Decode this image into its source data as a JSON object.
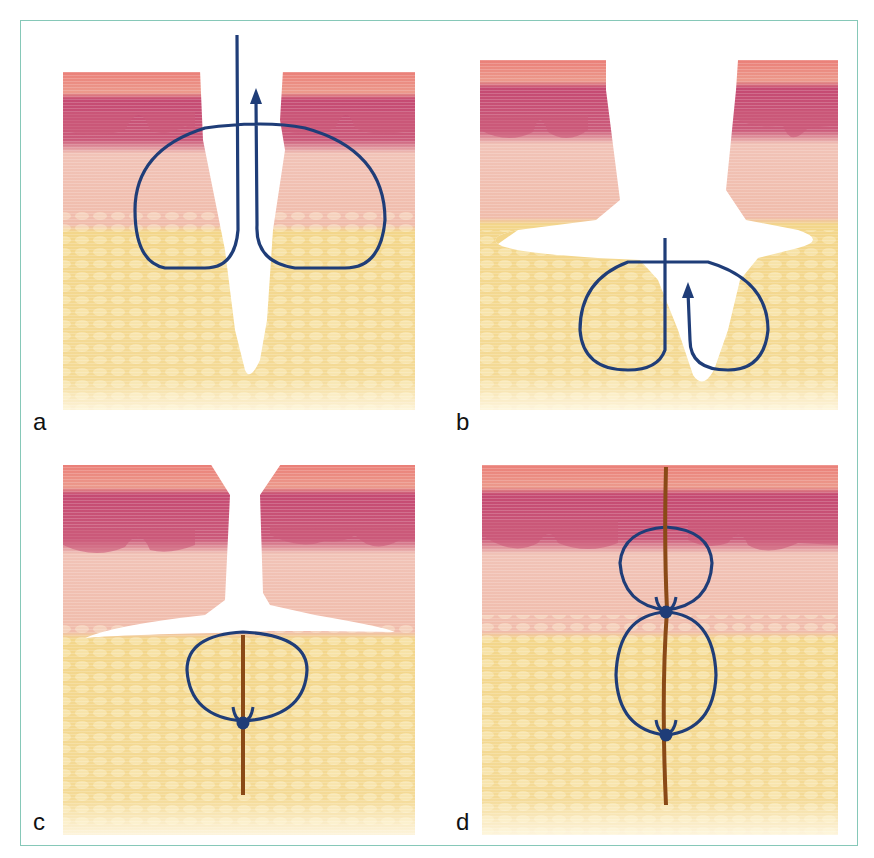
{
  "figure": {
    "frame_color": "#86c8b8",
    "colors": {
      "epidermis_top": "#ea7f78",
      "epidermis_mid": "#c3476d",
      "dermis": "#f3c2b6",
      "dermis_lower": "#eeb6a6",
      "fat": "#f3d68a",
      "fat_light": "#fbe9b8",
      "suture": "#1f3d78",
      "thread": "#8a4a17"
    },
    "panels": [
      {
        "id": "a",
        "label": "a",
        "description": "Deep wound; suture loop passes wide through dermis and subcutaneous fat with needle exiting upward (arrow)."
      },
      {
        "id": "b",
        "label": "b",
        "description": "Wound with undermined cavity in fat; suture loop placed deep in subcutaneous tissue with arrow upward."
      },
      {
        "id": "c",
        "label": "c",
        "description": "Deep subcutaneous suture tied with buried knot; dermal edges still separated above."
      },
      {
        "id": "d",
        "label": "d",
        "description": "Closed wound with two buried knots: one at dermis-fat junction and one deep in fat."
      }
    ]
  }
}
